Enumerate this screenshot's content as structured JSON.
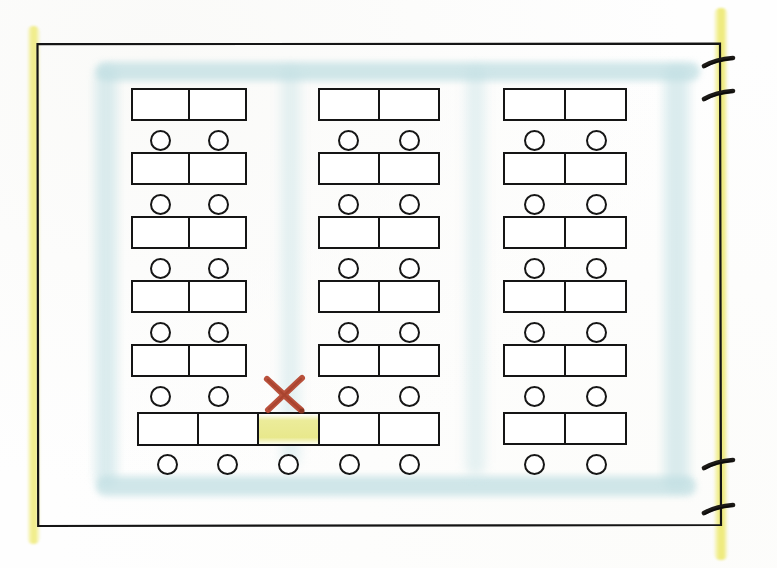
{
  "document": {
    "kind": "hand-drawn-floor-plan",
    "subject": "classroom seating plan",
    "orientation": "landscape"
  },
  "room": {
    "outline_name": "room-perimeter-wall",
    "outline_color": "#151515",
    "background_color": "#ffffff",
    "bounds": {
      "x": 36,
      "y": 43,
      "width": 686,
      "height": 484
    }
  },
  "colors": {
    "ink": "#151515",
    "circulation_wash": "#bfdee2",
    "highlight_yellow": "#eeea78",
    "annotation_red": "#b4432c",
    "paper": "#ffffff"
  },
  "highlighter_strokes": [
    {
      "name": "left-edge-highlight",
      "color": "#eeea78",
      "orientation": "vertical",
      "side": "left"
    },
    {
      "name": "right-edge-highlight",
      "color": "#eeea78",
      "orientation": "vertical",
      "side": "right"
    }
  ],
  "circulation": {
    "label": "aisle-wash",
    "color": "#bfdee2",
    "regions": [
      {
        "name": "aisle-perimeter-top",
        "x": 96,
        "y": 62,
        "width": 604,
        "height": 19
      },
      {
        "name": "aisle-perimeter-left",
        "x": 95,
        "y": 66,
        "width": 22,
        "height": 420
      },
      {
        "name": "aisle-perimeter-bottom",
        "x": 96,
        "y": 476,
        "width": 600,
        "height": 20
      },
      {
        "name": "aisle-perimeter-right",
        "x": 664,
        "y": 66,
        "width": 25,
        "height": 424
      },
      {
        "name": "aisle-between-column-1-and-2",
        "x": 281,
        "y": 66,
        "width": 19,
        "height": 400
      },
      {
        "name": "aisle-between-column-2-and-3",
        "x": 466,
        "y": 66,
        "width": 19,
        "height": 410
      }
    ]
  },
  "desk_columns": [
    {
      "name": "desk-column-left",
      "x": 131,
      "width": 116,
      "seats_per_desk": 2,
      "rows": [
        {
          "name": "desk-row-1",
          "y": 88,
          "cells": 2,
          "marked_cell": null
        },
        {
          "name": "desk-row-2",
          "y": 152,
          "cells": 2,
          "marked_cell": null
        },
        {
          "name": "desk-row-3",
          "y": 216,
          "cells": 2,
          "marked_cell": null
        },
        {
          "name": "desk-row-4",
          "y": 280,
          "cells": 2,
          "marked_cell": null
        },
        {
          "name": "desk-row-5",
          "y": 344,
          "cells": 2,
          "marked_cell": null
        }
      ]
    },
    {
      "name": "desk-column-center",
      "x": 318,
      "width": 122,
      "seats_per_desk": 2,
      "rows": [
        {
          "name": "desk-row-1",
          "y": 88,
          "cells": 2,
          "marked_cell": null
        },
        {
          "name": "desk-row-2",
          "y": 152,
          "cells": 2,
          "marked_cell": null
        },
        {
          "name": "desk-row-3",
          "y": 216,
          "cells": 2,
          "marked_cell": null
        },
        {
          "name": "desk-row-4",
          "y": 280,
          "cells": 2,
          "marked_cell": null
        },
        {
          "name": "desk-row-5",
          "y": 344,
          "cells": 2,
          "marked_cell": null
        }
      ]
    },
    {
      "name": "desk-column-right",
      "x": 503,
      "width": 124,
      "seats_per_desk": 2,
      "rows": [
        {
          "name": "desk-row-1",
          "y": 88,
          "cells": 2,
          "marked_cell": null
        },
        {
          "name": "desk-row-2",
          "y": 152,
          "cells": 2,
          "marked_cell": null
        },
        {
          "name": "desk-row-3",
          "y": 216,
          "cells": 2,
          "marked_cell": null
        },
        {
          "name": "desk-row-4",
          "y": 280,
          "cells": 2,
          "marked_cell": null
        },
        {
          "name": "desk-row-5",
          "y": 344,
          "cells": 2,
          "marked_cell": null
        },
        {
          "name": "desk-row-6",
          "y": 412,
          "cells": 2,
          "marked_cell": null
        }
      ]
    }
  ],
  "front_bench": {
    "name": "front-row-long-bench",
    "x": 137,
    "y": 412,
    "width": 303,
    "height": 34,
    "cells": 5,
    "marked_cell_index": 2,
    "marked_cell_name": "highlighted-seat-position",
    "marked_cell_color": "#e6e682",
    "chair_count": 5
  },
  "annotations": [
    {
      "name": "crossed-out-seat-marker",
      "glyph": "x-mark",
      "color": "#b4432c",
      "x": 262,
      "y": 376,
      "width": 44,
      "height": 36,
      "meaning": "seat-removed"
    }
  ],
  "doors": [
    {
      "name": "door-right-upper-1",
      "x": 722,
      "y": 62,
      "wall": "right"
    },
    {
      "name": "door-right-upper-2",
      "x": 722,
      "y": 95,
      "wall": "right"
    },
    {
      "name": "door-right-lower-1",
      "x": 722,
      "y": 464,
      "wall": "right"
    },
    {
      "name": "door-right-lower-2",
      "x": 722,
      "y": 509,
      "wall": "right"
    }
  ],
  "counts": {
    "desk_columns": 3,
    "standard_desk_rows": 5,
    "total_chairs": 67
  }
}
